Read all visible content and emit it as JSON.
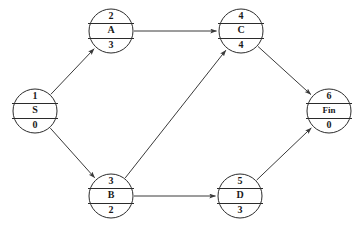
{
  "diagram": {
    "background_color": "#ffffff",
    "line_color": "#3a3a3a",
    "node_stroke_color": "#2b2b2b",
    "nodes": [
      {
        "id": "S",
        "number": "1",
        "label": "S",
        "duration": "0",
        "cx": 35,
        "cy": 111
      },
      {
        "id": "A",
        "number": "2",
        "label": "A",
        "duration": "3",
        "cx": 111,
        "cy": 31
      },
      {
        "id": "B",
        "number": "3",
        "label": "B",
        "duration": "2",
        "cx": 111,
        "cy": 196
      },
      {
        "id": "C",
        "number": "4",
        "label": "C",
        "duration": "4",
        "cx": 241,
        "cy": 31
      },
      {
        "id": "D",
        "number": "5",
        "label": "D",
        "duration": "3",
        "cx": 240,
        "cy": 196
      },
      {
        "id": "Fin",
        "number": "6",
        "label": "Fin",
        "duration": "0",
        "cx": 329,
        "cy": 111
      }
    ],
    "edges": [
      {
        "from": "S",
        "to": "A"
      },
      {
        "from": "S",
        "to": "B"
      },
      {
        "from": "A",
        "to": "C"
      },
      {
        "from": "B",
        "to": "C"
      },
      {
        "from": "B",
        "to": "D"
      },
      {
        "from": "C",
        "to": "Fin"
      },
      {
        "from": "D",
        "to": "Fin"
      }
    ]
  }
}
